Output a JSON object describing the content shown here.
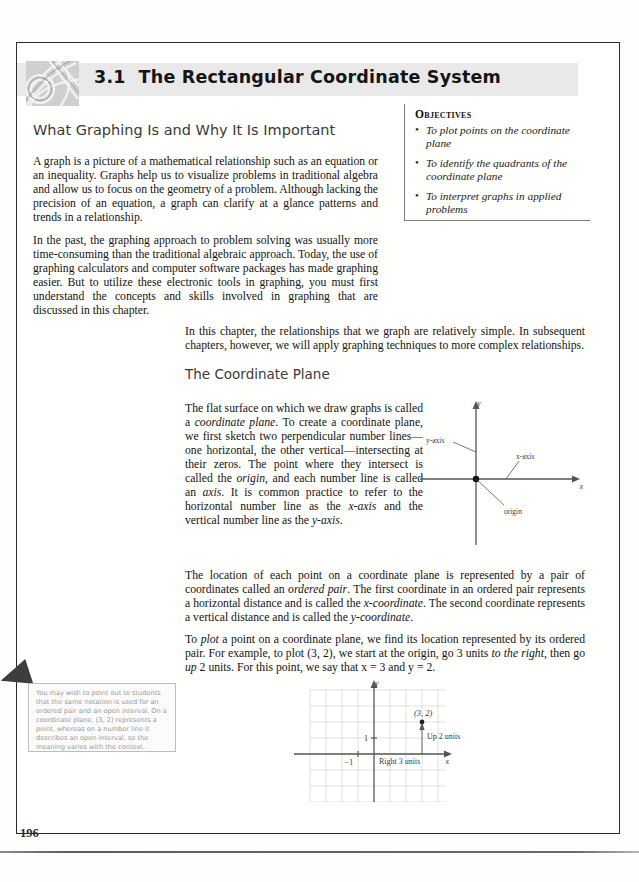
{
  "page": {
    "number": "196"
  },
  "header": {
    "section_number": "3.1",
    "section_title": "The Rectangular Coordinate System",
    "decoration_icon": "decorative-pattern-tile"
  },
  "objectives": {
    "title": "Objectives",
    "bullet_glyph": "•",
    "items": [
      "To plot points on the coordinate plane",
      "To identify the quadrants of the coordinate plane",
      "To interpret graphs in applied problems"
    ]
  },
  "content": {
    "subhead_1": "What Graphing Is and Why It Is Important",
    "paragraph_1": "A graph is a picture of a mathematical relationship such as an equation or an inequality. Graphs help us to visualize problems in traditional algebra and allow us to focus on the geometry of a problem. Although lacking the precision of an equation, a graph can clarify at a glance patterns and trends in a relationship.",
    "paragraph_2": "In the past, the graphing approach to problem solving was usually more time-consuming than the traditional algebraic approach. Today, the use of graphing calculators and computer software packages has made graphing easier. But to utilize these electronic tools in graphing, you must first understand the concepts and skills involved in graphing that are discussed in this chapter.",
    "paragraph_3": "In this chapter, the relationships that we graph are relatively simple. In subsequent chapters, however, we will apply graphing techniques to more complex relationships.",
    "subhead_2": "The Coordinate Plane",
    "paragraph_4_parts": {
      "a": "The flat surface on which we draw graphs is called a ",
      "i1": "coordinate plane",
      "b": ". To create a coordinate plane, we first sketch two perpendicular number lines—one horizontal, the other vertical—intersecting at their zeros. The point where they intersect is called the ",
      "i2": "origin",
      "c": ", and each number line is called an ",
      "i3": "axis",
      "d": ". It is common practice to refer to the horizontal number line as the ",
      "i4": "x-axis",
      "e": " and the vertical number line as the ",
      "i5": "y-axis",
      "f": "."
    },
    "paragraph_5_parts": {
      "a": "The location of each point on a coordinate plane is represented by a pair of coordinates called an ",
      "i1": "ordered pair",
      "b": ". The first coordinate in an ordered pair represents a horizontal distance and is called the ",
      "i2": "x-coordinate",
      "c": ". The second coordinate represents a vertical distance and is called the ",
      "i3": "y-coordinate",
      "d": "."
    },
    "paragraph_6_parts": {
      "a": "To ",
      "i1": "plot",
      "b": " a point on a coordinate plane, we find its location represented by its ordered pair. For example, to plot (3, 2), we start at the origin, go 3 units ",
      "i2": "to the right",
      "c": ", then go ",
      "i3": "up",
      "d": " 2 units. For this point, we say that x = 3 and y = 2."
    }
  },
  "note_box": {
    "text": "You may wish to point out to students that the same notation is used for an ordered pair and an open interval. On a coordinate plane, (3, 2) represents a point, whereas on a number line it describes an open interval, so the meaning varies with the context.",
    "pointer_icon": "left-arrow-marker"
  },
  "figures": {
    "axes_diagram": {
      "name": "coordinate-plane-axes-diagram",
      "labels": {
        "y_axis_tip": "y",
        "x_axis_tip": "x",
        "y_axis_callout": "y-axis",
        "x_axis_callout": "x-axis",
        "origin_callout": "origin"
      }
    },
    "grid_plot": {
      "name": "plot-point-3-2-grid",
      "labels": {
        "y_axis_tip": "y",
        "x_axis_tip": "x",
        "point_label": "(3, 2)",
        "up_label": "Up 2 units",
        "right_label": "Right 3 units",
        "tick_pos_one": "1",
        "tick_neg_one": "−1"
      },
      "point": {
        "x": 3,
        "y": 2
      },
      "grid": {
        "x_min": -4,
        "x_max": 5,
        "y_min": -4,
        "y_max": 4,
        "step": 1
      }
    }
  }
}
